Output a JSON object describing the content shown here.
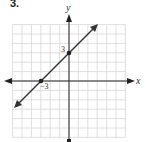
{
  "problem": {
    "number": "3."
  },
  "chart_data": {
    "type": "line",
    "title": "",
    "xlabel": "x",
    "ylabel": "y",
    "xlim": [
      -6,
      6
    ],
    "ylim": [
      -6,
      6
    ],
    "grid": true,
    "legend": null,
    "series": [
      {
        "name": "line",
        "equation": "y = x + 3",
        "x": [
          -5.5,
          3
        ],
        "y": [
          -2.5,
          6
        ]
      }
    ],
    "points": [
      {
        "x": 0,
        "y": 3,
        "label": "3"
      },
      {
        "x": -3,
        "y": 0,
        "label": "−3"
      }
    ],
    "annotations": [
      "3",
      "−3"
    ]
  },
  "labels": {
    "x_axis": "x",
    "y_axis": "y",
    "y_intercept": "3",
    "x_intercept": "−3"
  },
  "colors": {
    "grid": "#d8d8d8",
    "axis": "#222222",
    "line": "#333333"
  }
}
